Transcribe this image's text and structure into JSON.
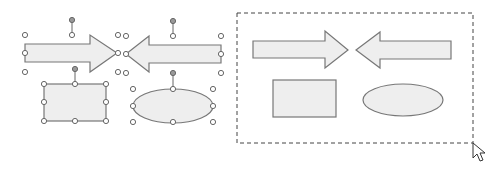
{
  "colors": {
    "shape_fill": "#eeeeee",
    "shape_stroke": "#777777",
    "handle_stroke": "#666666",
    "handle_fill": "#ffffff",
    "rotate_handle_fill": "#999999",
    "selection_dash": "#444444",
    "cursor_stroke": "#333333"
  },
  "left_group": {
    "label": "Selected shapes with handles",
    "shapes": [
      "right-arrow",
      "left-arrow",
      "rectangle",
      "ellipse"
    ]
  },
  "right_group": {
    "label": "Marquee selection",
    "shapes": [
      "right-arrow",
      "left-arrow",
      "rectangle",
      "ellipse"
    ]
  },
  "cursor": {
    "icon": "mouse-pointer-icon"
  }
}
